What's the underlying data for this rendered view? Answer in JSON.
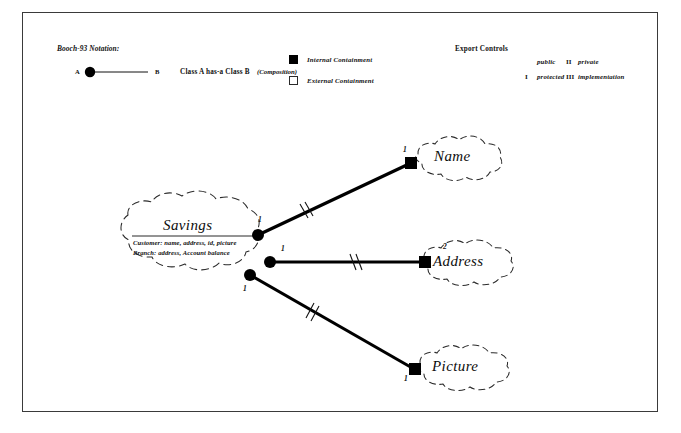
{
  "diagram": {
    "title_visible": false,
    "border_color": "#3a3a3a",
    "ink_color": "#000000"
  },
  "legend": {
    "notation_heading": "Booch-93 Notation:",
    "endpoint_a_label": "A",
    "endpoint_b_label": "B",
    "relation_phrase": "Class A  has-a  Class B",
    "relation_kind": "(Composition)",
    "containment": [
      {
        "swatch": "filled-square",
        "label": "Internal Containment"
      },
      {
        "swatch": "open-square",
        "label": "External Containment"
      }
    ]
  },
  "export_controls": {
    "heading": "Export Controls",
    "items": [
      {
        "mark": "",
        "label": "public"
      },
      {
        "mark": "II",
        "label": "private"
      },
      {
        "mark": "I",
        "label": "protected"
      },
      {
        "mark": "III",
        "label": "implementation"
      }
    ]
  },
  "classes": [
    {
      "id": "savings",
      "name": "Savings",
      "attributes": [
        "Customer: name, address, id, picture",
        "Branch: address, Account balance"
      ]
    },
    {
      "id": "name",
      "name": "Name",
      "attributes": []
    },
    {
      "id": "address",
      "name": "Address",
      "attributes": []
    },
    {
      "id": "picture",
      "name": "Picture",
      "attributes": []
    }
  ],
  "relationships": [
    {
      "from": "savings",
      "to": "name",
      "source_multiplicity": "1",
      "target_multiplicity": "1",
      "containment": "internal",
      "export_mark": "II"
    },
    {
      "from": "savings",
      "to": "address",
      "source_multiplicity": "1",
      "target_multiplicity": "2",
      "containment": "internal",
      "export_mark": "II"
    },
    {
      "from": "savings",
      "to": "picture",
      "source_multiplicity": "1",
      "target_multiplicity": "1",
      "containment": "internal",
      "export_mark": "II"
    }
  ]
}
